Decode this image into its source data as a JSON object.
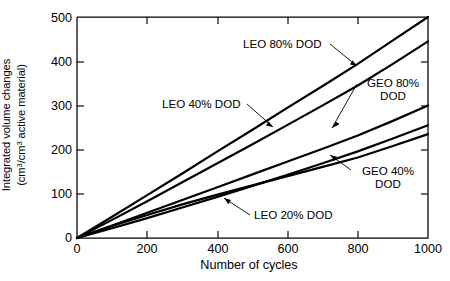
{
  "chart_data": {
    "type": "line",
    "title": "",
    "xlabel": "Number of cycles",
    "ylabel_line1": "Integrated volume changes",
    "ylabel_line2_pre": "(cm",
    "ylabel_line2_sup1": "3",
    "ylabel_line2_mid": "/cm",
    "ylabel_line2_sup2": "3",
    "ylabel_line2_post": " active material)",
    "ylabel_plain": "Integrated volume changes (cm3/cm3 active material)",
    "xlim": [
      0,
      1000
    ],
    "ylim": [
      0,
      500
    ],
    "xticks": [
      0,
      200,
      400,
      600,
      800,
      1000
    ],
    "yticks": [
      0,
      100,
      200,
      300,
      400,
      500
    ],
    "xtick_labels": [
      "0",
      "200",
      "400",
      "600",
      "800",
      "1000"
    ],
    "ytick_labels": [
      "0",
      "100",
      "200",
      "300",
      "400",
      "500"
    ],
    "grid": false,
    "legend": "annotations-inline",
    "line_color": "#000000",
    "series": [
      {
        "name": "LEO 80% DOD",
        "label": "LEO 80% DOD",
        "x": [
          0,
          100,
          200,
          300,
          400,
          500,
          600,
          700,
          800,
          900,
          1000
        ],
        "values": [
          0,
          48,
          97,
          146,
          196,
          245,
          295,
          344,
          394,
          447,
          500
        ]
      },
      {
        "name": "LEO 40% DOD",
        "label": "LEO 40% DOD",
        "x": [
          0,
          100,
          200,
          300,
          400,
          500,
          600,
          700,
          800,
          900,
          1000
        ],
        "values": [
          0,
          41,
          83,
          126,
          169,
          212,
          256,
          300,
          345,
          394,
          445
        ]
      },
      {
        "name": "GEO 80% DOD",
        "label": "GEO 80% DOD",
        "label_line1": "GEO 80%",
        "label_line2": "DOD",
        "x": [
          0,
          100,
          200,
          300,
          400,
          500,
          600,
          700,
          800,
          900,
          1000
        ],
        "values": [
          0,
          28,
          57,
          86,
          115,
          144,
          173,
          202,
          232,
          265,
          300
        ]
      },
      {
        "name": "GEO 40% DOD",
        "label": "GEO 40% DOD",
        "label_line1": "GEO 40%",
        "label_line2": "DOD",
        "x": [
          0,
          100,
          200,
          300,
          400,
          500,
          600,
          700,
          800,
          900,
          1000
        ],
        "values": [
          0,
          22,
          45,
          69,
          93,
          118,
          143,
          169,
          196,
          225,
          255
        ]
      },
      {
        "name": "LEO 20% DOD",
        "label": "LEO 20% DOD",
        "x": [
          0,
          100,
          200,
          300,
          400,
          500,
          600,
          700,
          800,
          900,
          1000
        ],
        "values": [
          0,
          27,
          52,
          76,
          98,
          119,
          140,
          161,
          182,
          208,
          235
        ]
      }
    ],
    "annotations": [
      {
        "text": "LEO 80% DOD",
        "target_x": 800,
        "target_y": 394
      },
      {
        "text": "LEO 40% DOD",
        "target_x": 540,
        "target_y": 229
      },
      {
        "text": "GEO 80% DOD",
        "target_x": 800,
        "target_y": 232
      },
      {
        "text": "GEO 40% DOD",
        "target_x": 760,
        "target_y": 185
      },
      {
        "text": "LEO 20% DOD",
        "target_x": 420,
        "target_y": 103
      }
    ]
  },
  "axes": {
    "x": {
      "title": "Number of cycles",
      "ticks": [
        "0",
        "200",
        "400",
        "600",
        "800",
        "1000"
      ]
    },
    "y": {
      "ticks": [
        "500",
        "400",
        "300",
        "200",
        "100",
        "0"
      ]
    }
  }
}
